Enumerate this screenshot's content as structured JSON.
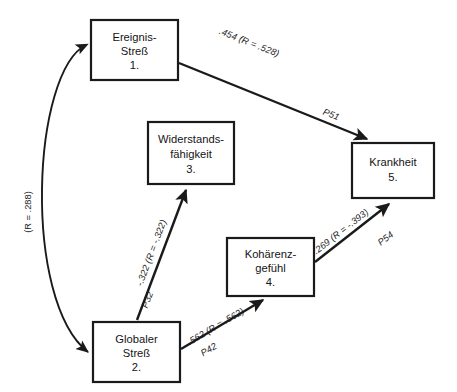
{
  "diagram": {
    "background_color": "#ffffff",
    "line_color": "#1a1a1a",
    "nodes": [
      {
        "id": "ereignis-stress",
        "number": "1.",
        "line1": "Ereignis-",
        "line2": "Streß",
        "x": 91,
        "y": 20,
        "w": 87,
        "h": 60
      },
      {
        "id": "globaler-stress",
        "number": "2.",
        "line1": "Globaler",
        "line2": "Streß",
        "x": 93,
        "y": 322,
        "w": 87,
        "h": 60
      },
      {
        "id": "widerstandsfaehigkeit",
        "number": "3.",
        "line1": "Widerstands-",
        "line2": "fähigkeit",
        "x": 148,
        "y": 122,
        "w": 86,
        "h": 62
      },
      {
        "id": "kohaerenzgefuehl",
        "number": "4.",
        "line1": "Kohärenz-",
        "line2": "gefühl",
        "x": 227,
        "y": 238,
        "w": 87,
        "h": 58
      },
      {
        "id": "krankheit",
        "number": "5.",
        "line1": "Krankheit",
        "line2": "",
        "x": 352,
        "y": 143,
        "w": 82,
        "h": 55
      }
    ],
    "edges": [
      {
        "id": "edge-1-5",
        "from": "ereignis-stress",
        "to": "krankheit",
        "coefficient": ".454 (R = .528)",
        "path_label": "P51"
      },
      {
        "id": "edge-2-3",
        "from": "globaler-stress",
        "to": "widerstandsfaehigkeit",
        "coefficient": "-.322 (R = -.322)",
        "path_label": "P32"
      },
      {
        "id": "edge-2-4",
        "from": "globaler-stress",
        "to": "kohaerenzgefuehl",
        "coefficient": ".562 (R = .562)",
        "path_label": "P42"
      },
      {
        "id": "edge-4-5",
        "from": "kohaerenzgefuehl",
        "to": "krankheit",
        "coefficient": "-.269 (R = -.393)",
        "path_label": "P54"
      },
      {
        "id": "edge-1-2-correlation",
        "from": "ereignis-stress",
        "to": "globaler-stress",
        "coefficient": "(R = .288)",
        "path_label": ""
      }
    ]
  }
}
